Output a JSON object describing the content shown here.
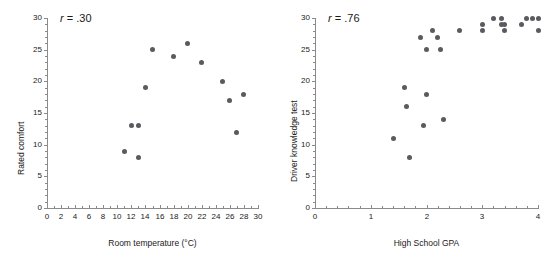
{
  "figure": {
    "panel_count": 2,
    "background": "#ffffff",
    "dot_color": "#5a5a5f",
    "axis_color": "#8a8a8a",
    "text_color": "#1a1a1a"
  },
  "chart_data": [
    {
      "type": "scatter",
      "title": "",
      "annotation": "r = .30",
      "annotation_symbol": "r",
      "annotation_value": "= .30",
      "correlation": 0.3,
      "xlabel": "Room temperature (°C)",
      "ylabel": "Rated comfort",
      "xlim": [
        0,
        30
      ],
      "ylim": [
        0,
        30
      ],
      "xticks": [
        0,
        2,
        4,
        6,
        8,
        10,
        12,
        14,
        16,
        18,
        20,
        22,
        24,
        26,
        28,
        30
      ],
      "xticklabels": [
        "0",
        "2",
        "4",
        "6",
        "8",
        "10",
        "12",
        "14",
        "16",
        "18",
        "20",
        "22",
        "24",
        "26",
        "28",
        "30"
      ],
      "yticks": [
        0,
        5,
        10,
        15,
        20,
        25,
        30
      ],
      "yticklabels": [
        "0",
        "5",
        "10",
        "15",
        "20",
        "25",
        "30"
      ],
      "x_minor_step": 1,
      "y_minor_step": 1,
      "grid": false,
      "legend": false,
      "points": [
        {
          "x": 11,
          "y": 9
        },
        {
          "x": 12,
          "y": 13
        },
        {
          "x": 13,
          "y": 13
        },
        {
          "x": 13,
          "y": 8
        },
        {
          "x": 14,
          "y": 19
        },
        {
          "x": 15,
          "y": 25
        },
        {
          "x": 18,
          "y": 24
        },
        {
          "x": 20,
          "y": 26
        },
        {
          "x": 22,
          "y": 23
        },
        {
          "x": 25,
          "y": 20
        },
        {
          "x": 26,
          "y": 17
        },
        {
          "x": 27,
          "y": 12
        },
        {
          "x": 28,
          "y": 18
        }
      ]
    },
    {
      "type": "scatter",
      "title": "",
      "annotation": "r = .76",
      "annotation_symbol": "r",
      "annotation_value": "= .76",
      "correlation": 0.76,
      "xlabel": "High School GPA",
      "ylabel": "Driver knowledge test",
      "xlim": [
        0,
        4
      ],
      "ylim": [
        0,
        30
      ],
      "xticks": [
        0,
        1,
        2,
        3,
        4
      ],
      "xticklabels": [
        "0",
        "1",
        "2",
        "3",
        "4"
      ],
      "yticks": [
        0,
        5,
        10,
        15,
        20,
        25,
        30
      ],
      "yticklabels": [
        "0",
        "5",
        "10",
        "15",
        "20",
        "25",
        "30"
      ],
      "x_minor_step": 0.2,
      "y_minor_step": 1,
      "grid": false,
      "legend": false,
      "points": [
        {
          "x": 1.4,
          "y": 11
        },
        {
          "x": 1.6,
          "y": 19
        },
        {
          "x": 1.65,
          "y": 16
        },
        {
          "x": 1.7,
          "y": 8
        },
        {
          "x": 1.9,
          "y": 27
        },
        {
          "x": 1.95,
          "y": 13
        },
        {
          "x": 2.0,
          "y": 25
        },
        {
          "x": 2.0,
          "y": 18
        },
        {
          "x": 2.1,
          "y": 28
        },
        {
          "x": 2.2,
          "y": 27
        },
        {
          "x": 2.25,
          "y": 25
        },
        {
          "x": 2.3,
          "y": 14
        },
        {
          "x": 2.6,
          "y": 28
        },
        {
          "x": 3.0,
          "y": 29
        },
        {
          "x": 3.0,
          "y": 28
        },
        {
          "x": 3.2,
          "y": 30
        },
        {
          "x": 3.35,
          "y": 30
        },
        {
          "x": 3.35,
          "y": 29
        },
        {
          "x": 3.4,
          "y": 29
        },
        {
          "x": 3.4,
          "y": 28
        },
        {
          "x": 3.7,
          "y": 29
        },
        {
          "x": 3.8,
          "y": 30
        },
        {
          "x": 3.9,
          "y": 30
        },
        {
          "x": 4.0,
          "y": 30
        },
        {
          "x": 4.0,
          "y": 28
        }
      ]
    }
  ]
}
